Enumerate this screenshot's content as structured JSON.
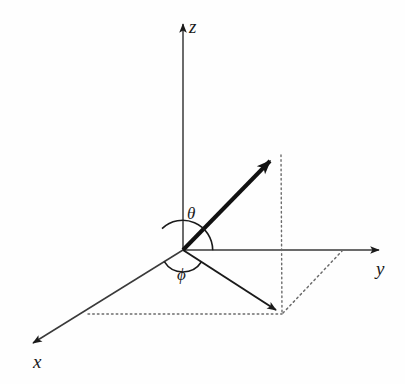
{
  "figure": {
    "background_color": "#fefefe",
    "ink_color": "#1a1a1a",
    "dotted_color": "#6b6b6b",
    "axis_color": "#3a3a3a"
  },
  "axes": [
    {
      "name": "z-axis",
      "label": "z",
      "label_x": 189,
      "label_y": 17,
      "from": [
        183,
        250
      ],
      "to": [
        183,
        18
      ],
      "arrowhead": true
    },
    {
      "name": "y-axis",
      "label": "y",
      "label_x": 376,
      "label_y": 259,
      "from": [
        183,
        250
      ],
      "to": [
        385,
        250
      ],
      "arrowhead": true
    },
    {
      "name": "x-axis",
      "label": "x",
      "label_x": 33,
      "label_y": 352,
      "from": [
        183,
        250
      ],
      "to": [
        27,
        347
      ],
      "arrowhead": true
    }
  ],
  "vectors": [
    {
      "name": "radial-vector",
      "from": [
        183,
        250
      ],
      "to": [
        279,
        152
      ],
      "stroke_width": 4,
      "arrowhead": true
    },
    {
      "name": "projection-vector",
      "from": [
        183,
        250
      ],
      "to": [
        283,
        314
      ],
      "stroke_width": 2,
      "arrowhead": true
    }
  ],
  "guides": [
    {
      "name": "vertical-drop-line",
      "from": [
        281,
        155
      ],
      "to": [
        282,
        313
      ],
      "style": "dotted"
    },
    {
      "name": "horizontal-projection-line",
      "from": [
        88,
        314
      ],
      "to": [
        282,
        314
      ],
      "style": "dotted"
    },
    {
      "name": "diagonal-to-y-axis-line",
      "from": [
        283,
        313
      ],
      "to": [
        342,
        251
      ],
      "style": "dotted"
    }
  ],
  "angles": [
    {
      "name": "theta",
      "symbol": "θ",
      "label_x": 187,
      "label_y": 205,
      "between": [
        "z-axis",
        "radial-vector"
      ],
      "arc_radius": 30,
      "arc_from_deg": 90,
      "arc_to_deg": 45.6
    },
    {
      "name": "phi",
      "symbol": "ϕ",
      "label_x": 177,
      "label_y": 266,
      "between": [
        "x-axis",
        "projection-vector"
      ],
      "arc_radius": 22,
      "arc_from_deg": 211.9,
      "arc_to_deg": 327.4
    }
  ],
  "origin": {
    "name": "origin",
    "x": 183,
    "y": 250
  }
}
